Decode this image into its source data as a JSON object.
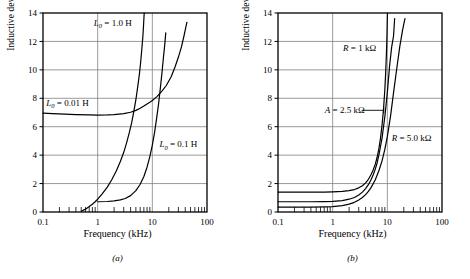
{
  "figure": {
    "panels": [
      {
        "id": "a",
        "caption": "(a)",
        "xlabel": "Frequency (kHz)",
        "ylabel": "Inductive deviation (%)"
      },
      {
        "id": "b",
        "caption": "(b)",
        "xlabel": "Frequency (kHz)",
        "ylabel": "Inductive deviation (%)"
      }
    ]
  },
  "chart_data": [
    {
      "type": "line",
      "title": "",
      "panel": "a",
      "xlabel": "Frequency (kHz)",
      "ylabel": "Inductive deviation (%)",
      "xscale": "log",
      "xlim": [
        0.1,
        100
      ],
      "ylim": [
        0,
        14
      ],
      "xticks": [
        0.1,
        1,
        10,
        100
      ],
      "xticklabels": [
        "0.1",
        "1",
        "10",
        "100"
      ],
      "yticks": [
        0,
        2,
        4,
        6,
        8,
        10,
        12,
        14
      ],
      "yticklabels": [
        "0",
        "2",
        "4",
        "6",
        "8",
        "10",
        "12",
        "14"
      ],
      "grid": "horizontal-and-decade-verticals",
      "legend_position": "inline-annotations",
      "series": [
        {
          "name": "L0 = 0.01 H",
          "label_parts": {
            "symbol": "L",
            "subscript": "0",
            "equals": " = ",
            "value": "0.01 H"
          },
          "label_x": 0.115,
          "label_y": 7.45,
          "points": [
            [
              0.1,
              6.95
            ],
            [
              0.15,
              6.92
            ],
            [
              0.25,
              6.88
            ],
            [
              0.4,
              6.85
            ],
            [
              0.7,
              6.83
            ],
            [
              1.0,
              6.82
            ],
            [
              1.5,
              6.83
            ],
            [
              2.0,
              6.85
            ],
            [
              3.0,
              6.92
            ],
            [
              4.0,
              7.02
            ],
            [
              5.0,
              7.15
            ],
            [
              6.0,
              7.3
            ],
            [
              7.0,
              7.45
            ],
            [
              8.0,
              7.6
            ],
            [
              9.0,
              7.72
            ],
            [
              10.0,
              7.85
            ],
            [
              12.0,
              8.1
            ],
            [
              15.0,
              8.5
            ],
            [
              18.0,
              8.9
            ],
            [
              22.0,
              9.5
            ],
            [
              26.0,
              10.2
            ],
            [
              30.0,
              10.9
            ],
            [
              34.0,
              11.6
            ],
            [
              38.0,
              12.4
            ],
            [
              41.0,
              13.0
            ],
            [
              43.0,
              13.35
            ]
          ]
        },
        {
          "name": "L0 = 1.0 H",
          "label_parts": {
            "symbol": "L",
            "subscript": "0",
            "equals": " = ",
            "value": "1.0 H"
          },
          "label_x": 0.85,
          "label_y": 13.1,
          "points": [
            [
              0.5,
              0.05
            ],
            [
              0.6,
              0.2
            ],
            [
              0.7,
              0.38
            ],
            [
              0.8,
              0.55
            ],
            [
              0.9,
              0.72
            ],
            [
              1.0,
              0.9
            ],
            [
              1.2,
              1.25
            ],
            [
              1.5,
              1.75
            ],
            [
              1.8,
              2.25
            ],
            [
              2.2,
              2.9
            ],
            [
              2.6,
              3.55
            ],
            [
              3.0,
              4.2
            ],
            [
              3.4,
              4.9
            ],
            [
              3.8,
              5.6
            ],
            [
              4.2,
              6.3
            ],
            [
              4.6,
              7.1
            ],
            [
              5.0,
              7.9
            ],
            [
              5.4,
              8.8
            ],
            [
              5.8,
              9.7
            ],
            [
              6.1,
              10.5
            ],
            [
              6.4,
              11.4
            ],
            [
              6.7,
              12.3
            ],
            [
              6.9,
              13.1
            ],
            [
              7.1,
              14.0
            ]
          ]
        },
        {
          "name": "L0 = 0.1 H",
          "label_parts": {
            "symbol": "L",
            "subscript": "0",
            "equals": " = ",
            "value": "0.1 H"
          },
          "label_x": 13.5,
          "label_y": 4.55,
          "points": [
            [
              1.0,
              0.72
            ],
            [
              1.5,
              0.74
            ],
            [
              2.0,
              0.78
            ],
            [
              2.6,
              0.85
            ],
            [
              3.2,
              0.95
            ],
            [
              4.0,
              1.15
            ],
            [
              5.0,
              1.5
            ],
            [
              6.0,
              1.95
            ],
            [
              7.0,
              2.5
            ],
            [
              8.0,
              3.15
            ],
            [
              9.0,
              3.9
            ],
            [
              10.0,
              4.7
            ],
            [
              11.0,
              5.6
            ],
            [
              12.0,
              6.6
            ],
            [
              13.0,
              7.6
            ],
            [
              14.0,
              8.7
            ],
            [
              15.0,
              9.8
            ],
            [
              16.0,
              10.9
            ],
            [
              17.0,
              11.9
            ],
            [
              17.6,
              12.6
            ]
          ]
        }
      ]
    },
    {
      "type": "line",
      "title": "",
      "panel": "b",
      "xlabel": "Frequency (kHz)",
      "ylabel": "Inductive deviation (%)",
      "xscale": "log",
      "xlim": [
        0.1,
        100
      ],
      "ylim": [
        0,
        14
      ],
      "xticks": [
        0.1,
        1,
        10,
        100
      ],
      "xticklabels": [
        "0.1",
        "1",
        "10",
        "100"
      ],
      "yticks": [
        0,
        2,
        4,
        6,
        8,
        10,
        12,
        14
      ],
      "yticklabels": [
        "0",
        "2",
        "4",
        "6",
        "8",
        "10",
        "12",
        "14"
      ],
      "grid": "horizontal-and-decade-verticals",
      "legend_position": "inline-annotations",
      "series": [
        {
          "name": "R = 1 kohm",
          "label_parts": {
            "symbol": "R",
            "subscript": "",
            "equals": " = ",
            "value": "1 kΩ"
          },
          "label_x": 1.55,
          "label_y": 11.35,
          "points": [
            [
              0.1,
              1.4
            ],
            [
              0.2,
              1.4
            ],
            [
              0.4,
              1.4
            ],
            [
              0.7,
              1.4
            ],
            [
              1.0,
              1.42
            ],
            [
              1.5,
              1.45
            ],
            [
              2.0,
              1.5
            ],
            [
              2.5,
              1.58
            ],
            [
              3.0,
              1.7
            ],
            [
              3.5,
              1.85
            ],
            [
              4.0,
              2.05
            ],
            [
              4.5,
              2.3
            ],
            [
              5.0,
              2.6
            ],
            [
              5.5,
              2.95
            ],
            [
              6.0,
              3.35
            ],
            [
              6.5,
              3.85
            ],
            [
              7.0,
              4.45
            ],
            [
              7.5,
              5.2
            ],
            [
              8.0,
              6.1
            ],
            [
              8.5,
              7.2
            ],
            [
              9.0,
              8.6
            ],
            [
              9.3,
              9.7
            ],
            [
              9.6,
              11.0
            ],
            [
              9.85,
              12.4
            ],
            [
              10.05,
              14.0
            ]
          ]
        },
        {
          "name": "A = 2.5 kohm",
          "label_parts": {
            "symbol": "A",
            "subscript": "",
            "equals": " = ",
            "value": "2.5 kΩ"
          },
          "label_x": 0.72,
          "label_y": 7.0,
          "points": [
            [
              0.1,
              0.72
            ],
            [
              0.2,
              0.72
            ],
            [
              0.4,
              0.72
            ],
            [
              0.7,
              0.73
            ],
            [
              1.0,
              0.75
            ],
            [
              1.5,
              0.8
            ],
            [
              2.0,
              0.9
            ],
            [
              2.5,
              1.02
            ],
            [
              3.0,
              1.2
            ],
            [
              3.5,
              1.4
            ],
            [
              4.0,
              1.65
            ],
            [
              4.5,
              1.92
            ],
            [
              5.0,
              2.25
            ],
            [
              5.5,
              2.6
            ],
            [
              6.0,
              3.0
            ],
            [
              6.5,
              3.45
            ],
            [
              7.0,
              4.0
            ],
            [
              8.0,
              5.2
            ],
            [
              9.0,
              6.7
            ],
            [
              10.0,
              8.4
            ],
            [
              11.0,
              10.3
            ],
            [
              12.0,
              11.6
            ],
            [
              13.0,
              12.4
            ],
            [
              13.6,
              13.6
            ]
          ]
        },
        {
          "name": "R = 5.0 kohm",
          "label_parts": {
            "symbol": "R",
            "subscript": "",
            "equals": " = ",
            "value": "5.0 kΩ"
          },
          "label_x": 12.0,
          "label_y": 5.0,
          "points": [
            [
              0.1,
              0.35
            ],
            [
              0.2,
              0.35
            ],
            [
              0.4,
              0.35
            ],
            [
              0.7,
              0.36
            ],
            [
              1.0,
              0.38
            ],
            [
              1.5,
              0.45
            ],
            [
              2.0,
              0.55
            ],
            [
              2.5,
              0.68
            ],
            [
              3.0,
              0.85
            ],
            [
              3.5,
              1.02
            ],
            [
              4.0,
              1.22
            ],
            [
              4.5,
              1.45
            ],
            [
              5.0,
              1.7
            ],
            [
              6.0,
              2.25
            ],
            [
              7.0,
              2.9
            ],
            [
              8.0,
              3.6
            ],
            [
              9.0,
              4.4
            ],
            [
              10.0,
              5.3
            ],
            [
              11.5,
              6.8
            ],
            [
              13.0,
              8.4
            ],
            [
              15.0,
              10.2
            ],
            [
              17.0,
              11.7
            ],
            [
              19.0,
              12.8
            ],
            [
              21.0,
              13.6
            ]
          ]
        }
      ]
    }
  ]
}
